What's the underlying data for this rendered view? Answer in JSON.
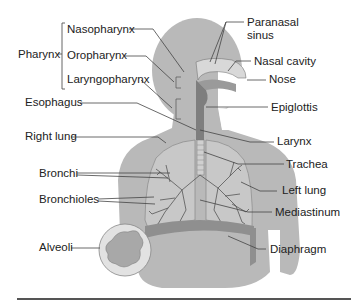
{
  "diagram": {
    "colors": {
      "body": "#b8b8b8",
      "lung": "#c6c6c6",
      "diaphragm": "#8e8e8e",
      "leader_line": "#444444",
      "text": "#222222",
      "rule": "#555555"
    },
    "group_label": "Pharynx",
    "labels": {
      "nasopharynx": "Nasopharynx",
      "oropharynx": "Oropharynx",
      "laryngopharynx": "Laryngopharynx",
      "pharynx": "Pharynx",
      "esophagus": "Esophagus",
      "right_lung": "Right lung",
      "bronchi": "Bronchi",
      "bronchioles": "Bronchioles",
      "alveoli": "Alveoli",
      "paranasal_sinus_1": "Paranasal",
      "paranasal_sinus_2": "sinus",
      "nasal_cavity": "Nasal cavity",
      "nose": "Nose",
      "epiglottis": "Epiglottis",
      "larynx": "Larynx",
      "trachea": "Trachea",
      "left_lung": "Left lung",
      "mediastinum": "Mediastinum",
      "diaphragm": "Diaphragm"
    }
  }
}
